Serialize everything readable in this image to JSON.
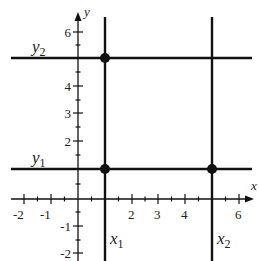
{
  "diagram": {
    "type": "coordinate-grid",
    "axes": {
      "x_label": "x",
      "y_label": "y",
      "x_ticks": [
        "-2",
        "-1",
        "2",
        "3",
        "4",
        "6"
      ],
      "y_ticks": [
        "6",
        "4",
        "3",
        "2",
        "-1",
        "-2"
      ],
      "x_range": [
        -2.5,
        6.5
      ],
      "y_range": [
        -2.2,
        6.8
      ]
    },
    "lines": {
      "vertical": [
        {
          "label": "x",
          "subscript": "1",
          "value": 1
        },
        {
          "label": "x",
          "subscript": "2",
          "value": 5
        }
      ],
      "horizontal": [
        {
          "label": "y",
          "subscript": "1",
          "value": 1
        },
        {
          "label": "y",
          "subscript": "2",
          "value": 5
        }
      ]
    },
    "points": [
      {
        "name": "(x1, y2)",
        "x": 1,
        "y": 5
      },
      {
        "name": "(x1, y1)",
        "x": 1,
        "y": 1
      },
      {
        "name": "(x2, y1)",
        "x": 5,
        "y": 1
      }
    ],
    "colors": {
      "ink": "#111111",
      "text": "#222222",
      "background": "#ffffff"
    }
  }
}
